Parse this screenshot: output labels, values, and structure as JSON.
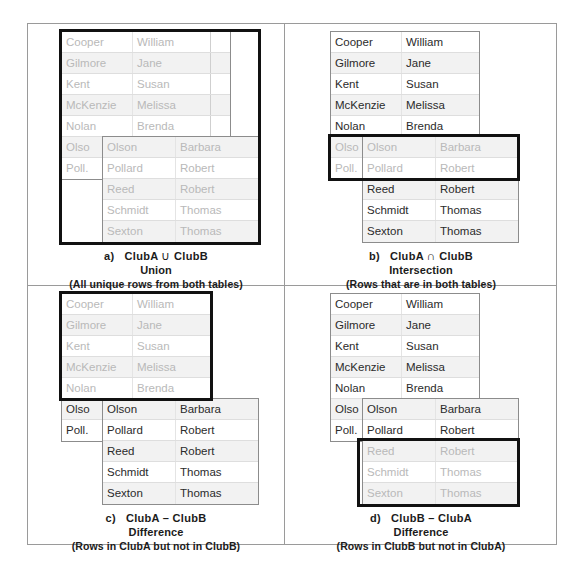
{
  "figure": {
    "clubA": {
      "name": "ClubA",
      "rows": [
        {
          "last": "Cooper",
          "first": "William"
        },
        {
          "last": "Gilmore",
          "first": "Jane"
        },
        {
          "last": "Kent",
          "first": "Susan"
        },
        {
          "last": "McKenzie",
          "first": "Melissa"
        },
        {
          "last": "Nolan",
          "first": "Brenda"
        },
        {
          "last": "Olson",
          "first": "Barbara"
        },
        {
          "last": "Pollard",
          "first": "Robert"
        }
      ],
      "clipped_labels": [
        "Olso",
        "Poll."
      ]
    },
    "clubB": {
      "name": "ClubB",
      "rows": [
        {
          "last": "Olson",
          "first": "Barbara"
        },
        {
          "last": "Pollard",
          "first": "Robert"
        },
        {
          "last": "Reed",
          "first": "Robert"
        },
        {
          "last": "Schmidt",
          "first": "Thomas"
        },
        {
          "last": "Sexton",
          "first": "Thomas"
        }
      ]
    },
    "panels": [
      {
        "id": "a",
        "marker": "a)",
        "operand_left": "ClubA",
        "symbol": "∪",
        "operand_right": "ClubB",
        "operation": "Union",
        "description": "(All unique rows from both tables)"
      },
      {
        "id": "b",
        "marker": "b)",
        "operand_left": "ClubA",
        "symbol": "∩",
        "operand_right": "ClubB",
        "operation": "Intersection",
        "description": "(Rows that are in both tables)"
      },
      {
        "id": "c",
        "marker": "c)",
        "operand_left": "ClubA",
        "symbol": "–",
        "operand_right": "ClubB",
        "operation": "Difference",
        "description": "(Rows in ClubA but not in ClubB)"
      },
      {
        "id": "d",
        "marker": "d)",
        "operand_left": "ClubB",
        "symbol": "–",
        "operand_right": "ClubA",
        "operation": "Difference",
        "description": "(Rows in ClubB but not in ClubA)"
      }
    ],
    "colors": {
      "highlight": "#111111",
      "table_border": "#8c8c8c",
      "frame": "#9a9a9a",
      "text": "#3f3f3f",
      "text_dim": "#b9b9b9",
      "row_alt": "#f2f2f2"
    }
  }
}
